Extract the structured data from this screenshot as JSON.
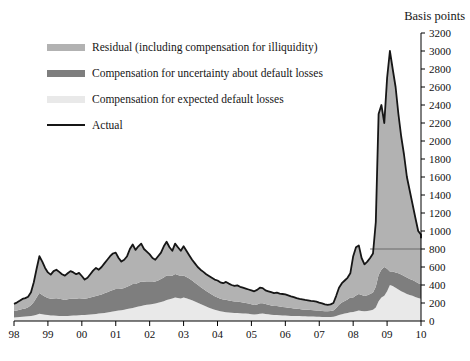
{
  "legend": [
    {
      "label": "Residual (including compensation for illiquidity)",
      "color": "#b2b2b2",
      "type": "area"
    },
    {
      "label": "Compensation for uncertainty about default losses",
      "color": "#7e7e7e",
      "type": "area"
    },
    {
      "label": "Compensation for expected default losses",
      "color": "#e9e9e9",
      "type": "area"
    },
    {
      "label": "Actual",
      "color": "#161616",
      "type": "line"
    }
  ],
  "chart_data": {
    "type": "area",
    "stacked": true,
    "y_axis_title": "Basis points",
    "ylim": [
      0,
      3200
    ],
    "y_tick_step": 200,
    "y_tick_labels": [
      "0",
      "200",
      "400",
      "600",
      "800",
      "1000",
      "1200",
      "1400",
      "1600",
      "1800",
      "2000",
      "2200",
      "2400",
      "2600",
      "2800",
      "3000",
      "3200"
    ],
    "x_start": 1998.0,
    "x_step": 0.0833333,
    "x_tick_labels": [
      "98",
      "99",
      "00",
      "01",
      "02",
      "03",
      "04",
      "05",
      "06",
      "07",
      "08",
      "09",
      "10"
    ],
    "grid": false,
    "legend_position": "top-left",
    "reference_line": {
      "value": 800,
      "x_from": 2008.5
    },
    "series": [
      {
        "name": "Compensation for expected default losses",
        "color": "#e9e9e9",
        "values": [
          40,
          42,
          45,
          48,
          50,
          52,
          55,
          60,
          70,
          80,
          75,
          70,
          65,
          62,
          60,
          58,
          57,
          56,
          55,
          56,
          58,
          60,
          62,
          64,
          66,
          68,
          70,
          72,
          75,
          78,
          82,
          86,
          90,
          95,
          100,
          105,
          110,
          115,
          120,
          126,
          132,
          138,
          145,
          152,
          160,
          168,
          175,
          180,
          185,
          190,
          196,
          202,
          210,
          220,
          232,
          242,
          250,
          260,
          255,
          250,
          260,
          252,
          242,
          230,
          216,
          202,
          188,
          174,
          160,
          148,
          136,
          125,
          115,
          108,
          102,
          98,
          95,
          92,
          90,
          88,
          86,
          84,
          82,
          80,
          76,
          73,
          75,
          80,
          82,
          78,
          74,
          70,
          67,
          65,
          63,
          61,
          60,
          58,
          57,
          56,
          55,
          54,
          53,
          52,
          51,
          50,
          49,
          48,
          47,
          46,
          45,
          45,
          46,
          48,
          55,
          65,
          75,
          82,
          90,
          98,
          100,
          108,
          115,
          112,
          108,
          112,
          118,
          125,
          150,
          220,
          260,
          280,
          330,
          400,
          390,
          370,
          350,
          330,
          315,
          300,
          290,
          280,
          268,
          255,
          248,
          240
        ]
      },
      {
        "name": "Compensation for uncertainty about default losses",
        "color": "#7e7e7e",
        "values": [
          70,
          75,
          80,
          85,
          90,
          100,
          120,
          150,
          190,
          230,
          215,
          200,
          190,
          185,
          190,
          195,
          190,
          185,
          180,
          185,
          190,
          188,
          185,
          188,
          185,
          180,
          182,
          188,
          195,
          200,
          205,
          210,
          218,
          225,
          232,
          240,
          245,
          240,
          238,
          242,
          248,
          258,
          265,
          258,
          265,
          272,
          262,
          255,
          250,
          245,
          242,
          248,
          255,
          265,
          272,
          262,
          252,
          262,
          256,
          250,
          245,
          238,
          230,
          220,
          210,
          200,
          190,
          182,
          174,
          166,
          158,
          150,
          145,
          140,
          136,
          138,
          134,
          130,
          127,
          128,
          124,
          120,
          117,
          114,
          110,
          106,
          110,
          118,
          116,
          110,
          106,
          102,
          99,
          100,
          97,
          95,
          93,
          90,
          87,
          84,
          81,
          78,
          76,
          74,
          73,
          72,
          71,
          70,
          68,
          66,
          64,
          63,
          65,
          70,
          90,
          115,
          130,
          140,
          150,
          162,
          160,
          175,
          185,
          178,
          170,
          175,
          182,
          190,
          230,
          290,
          310,
          320,
          250,
          150,
          160,
          170,
          180,
          185,
          185,
          182,
          178,
          174,
          170,
          165,
          162,
          160
        ]
      },
      {
        "name": "Residual (including compensation for illiquidity)",
        "color": "#b2b2b2",
        "values": [
          80,
          88,
          100,
          112,
          115,
          118,
          145,
          220,
          320,
          410,
          370,
          320,
          285,
          268,
          305,
          317,
          298,
          279,
          270,
          289,
          307,
          292,
          273,
          283,
          249,
          212,
          228,
          260,
          290,
          312,
          283,
          304,
          332,
          360,
          388,
          405,
          405,
          345,
          302,
          312,
          340,
          404,
          440,
          380,
          405,
          420,
          363,
          335,
          305,
          265,
          242,
          270,
          295,
          345,
          376,
          316,
          278,
          338,
          309,
          280,
          325,
          290,
          258,
          230,
          214,
          198,
          192,
          189,
          186,
          186,
          186,
          185,
          190,
          182,
          182,
          199,
          186,
          178,
          173,
          179,
          170,
          166,
          161,
          156,
          154,
          151,
          160,
          172,
          167,
          152,
          150,
          148,
          144,
          150,
          145,
          144,
          142,
          137,
          131,
          125,
          119,
          113,
          111,
          109,
          106,
          103,
          100,
          97,
          90,
          83,
          76,
          72,
          74,
          82,
          135,
          190,
          215,
          228,
          240,
          270,
          460,
          537,
          540,
          410,
          352,
          373,
          400,
          435,
          720,
          1790,
          1830,
          1600,
          2120,
          2450,
          2250,
          2060,
          1770,
          1535,
          1350,
          1118,
          982,
          846,
          712,
          580,
          550,
          520
        ]
      },
      {
        "name": "Actual",
        "color": "#161616",
        "type": "line",
        "values": [
          190,
          205,
          225,
          245,
          255,
          270,
          320,
          430,
          580,
          720,
          660,
          590,
          540,
          515,
          555,
          570,
          545,
          520,
          505,
          530,
          555,
          540,
          520,
          535,
          500,
          460,
          480,
          520,
          560,
          590,
          570,
          600,
          640,
          680,
          720,
          750,
          760,
          700,
          660,
          680,
          720,
          800,
          850,
          790,
          830,
          860,
          800,
          770,
          740,
          700,
          680,
          720,
          760,
          830,
          880,
          820,
          780,
          860,
          820,
          780,
          830,
          780,
          730,
          680,
          640,
          600,
          570,
          545,
          520,
          500,
          480,
          460,
          450,
          430,
          420,
          435,
          415,
          400,
          390,
          395,
          380,
          370,
          360,
          350,
          340,
          330,
          345,
          370,
          365,
          340,
          330,
          320,
          310,
          315,
          305,
          300,
          295,
          285,
          275,
          265,
          255,
          245,
          240,
          235,
          230,
          225,
          220,
          215,
          205,
          195,
          185,
          180,
          185,
          200,
          280,
          370,
          420,
          450,
          480,
          530,
          720,
          820,
          840,
          700,
          630,
          660,
          700,
          750,
          1100,
          2300,
          2400,
          2200,
          2700,
          3000,
          2800,
          2600,
          2300,
          2050,
          1850,
          1600,
          1450,
          1300,
          1150,
          1000,
          960,
          920
        ]
      }
    ]
  }
}
